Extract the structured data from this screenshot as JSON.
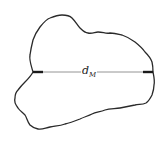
{
  "diagram": {
    "type": "particle-outline",
    "measurement": {
      "label_main": "d",
      "label_sub": "M",
      "line_y": 72,
      "x_start": 33,
      "x_end": 153
    },
    "colors": {
      "outline": "#2a2a2a",
      "dimension_line": "#888888",
      "arrow_heads": "#1a1a1a",
      "background": "#ffffff"
    }
  }
}
